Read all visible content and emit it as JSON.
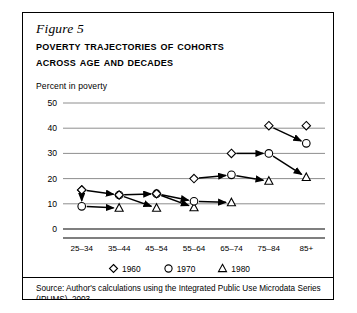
{
  "figure": {
    "number_label": "Figure 5",
    "title_line1": "Poverty Trajectories of Cohorts",
    "title_line2": "Across Age and Decades",
    "axis_note": "Percent in poverty",
    "source_note": "Source: Author's calculations using the Integrated Public Use Microdata Series (IPUMS), 2003."
  },
  "legend": {
    "items": [
      {
        "label": "1960",
        "marker": "diamond-marker"
      },
      {
        "label": "1970",
        "marker": "circle-marker"
      },
      {
        "label": "1980",
        "marker": "triangle-marker"
      }
    ]
  },
  "chart_data": {
    "type": "line",
    "title": "Poverty Trajectories of Cohorts Across Age and Decades",
    "xlabel": "",
    "ylabel": "Percent in poverty",
    "categories": [
      "25–34",
      "35–44",
      "45–54",
      "55–64",
      "65–74",
      "75–84",
      "85+"
    ],
    "yticks": [
      0,
      10,
      20,
      30,
      40,
      50
    ],
    "ylim": [
      0,
      50
    ],
    "grid": true,
    "legend_position": "bottom",
    "annotation": "Each cohort trajectory is drawn as an arrow running from its 1960 value through 1970 to 1980.",
    "trajectories": [
      {
        "name": "Cohort starting 25–34",
        "points": [
          {
            "x": "25–34",
            "decade": "1960",
            "y": 15.5
          },
          {
            "x": "25–34",
            "decade": "1970",
            "y": 9.0
          },
          {
            "x": "35–44",
            "decade": "1980",
            "y": 8.3
          }
        ]
      },
      {
        "name": "Cohort 25–34 to 45–54",
        "points": [
          {
            "x": "25–34",
            "decade": "1960",
            "y": 15.5
          },
          {
            "x": "35–44",
            "decade": "1970",
            "y": 13.5
          },
          {
            "x": "45–54",
            "decade": "1980",
            "y": 8.3
          }
        ]
      },
      {
        "name": "Cohort 35–44 to 55–64",
        "points": [
          {
            "x": "35–44",
            "decade": "1960",
            "y": 13.5
          },
          {
            "x": "45–54",
            "decade": "1970",
            "y": 14.0
          },
          {
            "x": "55–64",
            "decade": "1980",
            "y": 8.5
          }
        ]
      },
      {
        "name": "Cohort 45–54 to 65–74",
        "points": [
          {
            "x": "45–54",
            "decade": "1960",
            "y": 14.0
          },
          {
            "x": "55–64",
            "decade": "1970",
            "y": 11.0
          },
          {
            "x": "65–74",
            "decade": "1980",
            "y": 10.5
          }
        ]
      },
      {
        "name": "Cohort 55–64 to 75–84",
        "points": [
          {
            "x": "55–64",
            "decade": "1960",
            "y": 20.0
          },
          {
            "x": "65–74",
            "decade": "1970",
            "y": 21.5
          },
          {
            "x": "75–84",
            "decade": "1980",
            "y": 19.0
          }
        ]
      },
      {
        "name": "Cohort 65–74 to 85+",
        "points": [
          {
            "x": "65–74",
            "decade": "1960",
            "y": 30.0
          },
          {
            "x": "75–84",
            "decade": "1970",
            "y": 30.0
          },
          {
            "x": "85+",
            "decade": "1980",
            "y": 20.5
          }
        ]
      },
      {
        "name": "Cohort 75–84 to 85+",
        "points": [
          {
            "x": "75–84",
            "decade": "1960",
            "y": 41.0
          },
          {
            "x": "85+",
            "decade": "1970",
            "y": 34.0
          }
        ]
      },
      {
        "name": "Isolated 85+ 1960",
        "points": [
          {
            "x": "85+",
            "decade": "1960",
            "y": 41.0
          }
        ]
      }
    ]
  }
}
